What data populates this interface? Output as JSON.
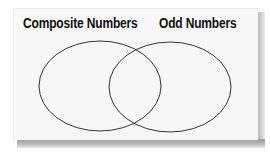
{
  "diagram": {
    "type": "venn",
    "sets": [
      {
        "id": "composite",
        "label": "Composite Numbers"
      },
      {
        "id": "odd",
        "label": "Odd Numbers"
      }
    ],
    "regions": {
      "composite_only": [],
      "intersection": [],
      "odd_only": []
    },
    "colors": {
      "panel_background": "#f7f7f7",
      "outline": "#333333",
      "text": "#111111",
      "shadow": "#a8a8a8"
    }
  }
}
